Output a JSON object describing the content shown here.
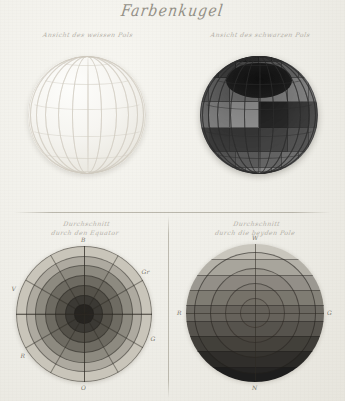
{
  "plate": {
    "title": "Farbenkugel",
    "paper_color": "#f2f1ec",
    "ink_color": "#5d584c"
  },
  "panels": {
    "top_left": {
      "name": "white-pole-sphere",
      "caption_line1": "Ansicht des weissen Pols",
      "caption_line2": "",
      "base_color": "#f6f5f1",
      "grid_color": "#cfcbc0",
      "meridian_count": 12,
      "parallel_count": 6
    },
    "top_right": {
      "name": "black-pole-sphere",
      "caption_line1": "Ansicht des schwarzen Pols",
      "caption_line2": "",
      "base_color": "#4a4a4a",
      "pole_cap_color": "#151515",
      "grid_color": "#2c2c2c",
      "meridian_count": 12,
      "parallel_count": 6,
      "patch_tones": [
        "#1a1a1a",
        "#242424",
        "#2e2e2e",
        "#3a3a3a",
        "#474747",
        "#555555",
        "#636363",
        "#717171",
        "#7f7f7f",
        "#8c8c8c",
        "#999999",
        "#a6a6a6"
      ]
    },
    "bottom_left": {
      "name": "equator-section-disc",
      "caption_line1": "Durchschnitt",
      "caption_line2": "durch den Equator",
      "center_color": "#1e1c19",
      "rim_color": "#cdcabf",
      "ring_tones": [
        "#262421",
        "#3b3934",
        "#55524a",
        "#6e6b62",
        "#8d8a80",
        "#aeaaa0",
        "#c9c5ba"
      ],
      "labels": [
        {
          "text": "B",
          "angle_deg": 0,
          "position": "top"
        },
        {
          "text": "Gr",
          "angle_deg": 55,
          "position": "upper-right"
        },
        {
          "text": "G",
          "angle_deg": 110,
          "position": "lower-right"
        },
        {
          "text": "O",
          "angle_deg": 180,
          "position": "bottom"
        },
        {
          "text": "R",
          "angle_deg": 235,
          "position": "lower-left"
        },
        {
          "text": "V",
          "angle_deg": 290,
          "position": "upper-left"
        }
      ],
      "spoke_count": 12
    },
    "bottom_right": {
      "name": "pole-section-disc",
      "caption_line1": "Durchschnitt",
      "caption_line2": "durch die beyden Pole",
      "top_pole_color": "#cfccc3",
      "bottom_pole_color": "#1d1d1d",
      "band_tones": [
        "#c9c6bd",
        "#b4b1a8",
        "#9b9891",
        "#858279",
        "#6d6a63",
        "#56534d",
        "#3f3d38",
        "#2a2926",
        "#1d1d1d"
      ],
      "ring_count": 4,
      "labels": [
        {
          "text": "W",
          "position": "top"
        },
        {
          "text": "G",
          "position": "right"
        },
        {
          "text": "N",
          "position": "bottom"
        },
        {
          "text": "R",
          "position": "left"
        }
      ]
    }
  },
  "chart_data": {
    "type": "diagram",
    "title": "Farbenkugel",
    "figures": [
      {
        "id": "fig1",
        "label": "Ansicht des weissen Pols",
        "kind": "sphere"
      },
      {
        "id": "fig2",
        "label": "Ansicht des schwarzen Pols",
        "kind": "sphere"
      },
      {
        "id": "fig3",
        "label": "Durchschnitt durch den Equator",
        "kind": "disc"
      },
      {
        "id": "fig4",
        "label": "Durchschnitt durch die beyden Pole",
        "kind": "disc"
      }
    ]
  }
}
